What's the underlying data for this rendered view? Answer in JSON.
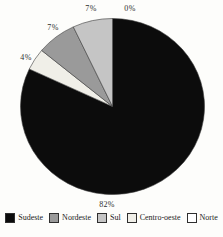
{
  "page": {
    "background_color": "#fdfdfb",
    "text_color": "#2e2e2e"
  },
  "chart_data": {
    "type": "pie",
    "title": "",
    "unit": "percent",
    "series": [
      {
        "label": "Sudeste",
        "value": 82,
        "display": "82%",
        "color": "#0c0c0c"
      },
      {
        "label": "Nordeste",
        "value": 7,
        "display": "7%",
        "color": "#9a9a9a"
      },
      {
        "label": "Sul",
        "value": 7,
        "display": "7%",
        "color": "#c5c5c5"
      },
      {
        "label": "Centro-oeste",
        "value": 4,
        "display": "4%",
        "color": "#f0efe8"
      },
      {
        "label": "Norte",
        "value": 0,
        "display": "0%",
        "color": "#ffffff"
      }
    ],
    "slice_draw_order_clockwise_from_top": [
      "Sudeste",
      "Centro-oeste",
      "Nordeste",
      "Sul",
      "Norte"
    ],
    "data_labels": "percent-outside",
    "legend_position": "bottom",
    "slice_stroke_color": "#3a3a3a"
  }
}
